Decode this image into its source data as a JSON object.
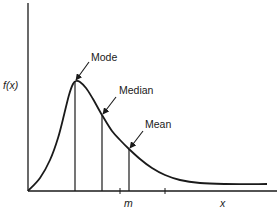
{
  "chart_data": {
    "type": "line",
    "title": "",
    "xlabel": "x",
    "ylabel": "f(x)",
    "grid": false,
    "legend": "none",
    "xlim": [
      0,
      10
    ],
    "ylim": [
      0,
      1
    ],
    "distribution": {
      "form": "skewed-right",
      "shape_k": 2.2,
      "scale": 1.0
    },
    "annotations": [
      {
        "label": "Mode",
        "marker": "vertical-line",
        "arrow": true
      },
      {
        "label": "Median",
        "marker": "vertical-line",
        "arrow": true
      },
      {
        "label": "Mean",
        "marker": "vertical-line",
        "arrow": true
      }
    ],
    "x_tick_labels": [
      "m"
    ],
    "x_tick_count": 2
  },
  "labels": {
    "y_axis": "f(x)",
    "x_axis": "x",
    "tick_m": "m",
    "mode": "Mode",
    "median": "Median",
    "mean": "Mean"
  },
  "colors": {
    "ink": "#1a1a1a",
    "background": "#ffffff"
  }
}
